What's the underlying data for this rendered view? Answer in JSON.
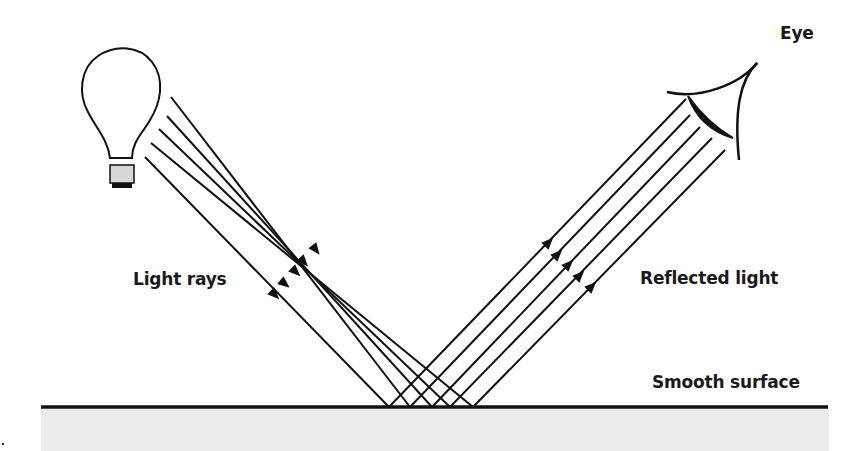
{
  "labels": {
    "light_rays": "Light rays",
    "reflected_light": "Reflected light",
    "smooth_surface": "Smooth surface",
    "eye": "Eye"
  },
  "colors": {
    "stroke": "#111111",
    "surface_fill": "#ececec",
    "bulb_base": "#d8d8d8",
    "background": "#ffffff"
  },
  "surface": {
    "x1": 41,
    "x2": 828,
    "y": 407
  },
  "incoming_rays": [
    {
      "start": [
        171,
        97
      ],
      "end": [
        410,
        407
      ],
      "arrow": [
        316,
        250
      ]
    },
    {
      "start": [
        167,
        116
      ],
      "end": [
        432,
        407
      ],
      "arrow": [
        304,
        262
      ]
    },
    {
      "start": [
        159,
        129
      ],
      "end": [
        450,
        407
      ],
      "arrow": [
        296,
        272
      ]
    },
    {
      "start": [
        151,
        143
      ],
      "end": [
        473,
        407
      ],
      "arrow": [
        285,
        284
      ]
    },
    {
      "start": [
        145,
        157
      ],
      "end": [
        389,
        407
      ],
      "arrow": [
        275,
        295
      ]
    }
  ],
  "reflected_rays": [
    {
      "start": [
        389,
        407
      ],
      "end": [
        686,
        99
      ],
      "arrow": [
        549,
        242
      ]
    },
    {
      "start": [
        410,
        407
      ],
      "end": [
        690,
        115
      ],
      "arrow": [
        558,
        254
      ]
    },
    {
      "start": [
        432,
        407
      ],
      "end": [
        700,
        127
      ],
      "arrow": [
        569,
        264
      ]
    },
    {
      "start": [
        450,
        407
      ],
      "end": [
        712,
        138
      ],
      "arrow": [
        580,
        275
      ]
    },
    {
      "start": [
        473,
        407
      ],
      "end": [
        725,
        150
      ],
      "arrow": [
        592,
        286
      ]
    }
  ]
}
